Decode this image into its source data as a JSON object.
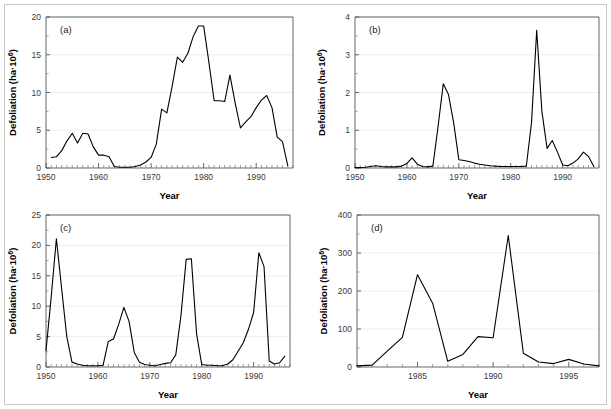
{
  "figure": {
    "background_color": "#ffffff",
    "line_color": "#000000",
    "grid_color": "#e9e9e9",
    "axis_color": "#555555"
  },
  "chart_data": [
    {
      "id": "a",
      "type": "line",
      "panel_label": "(a)",
      "title": "",
      "xlabel": "Year",
      "ylabel": "Defoliation (ha·10⁶)",
      "xlim": [
        1950,
        1997
      ],
      "ylim": [
        0,
        20
      ],
      "xticks": [
        1950,
        1960,
        1970,
        1980,
        1990
      ],
      "xtick_labels": [
        "1950",
        "1960",
        "1970",
        "1980",
        "1990"
      ],
      "yticks": [
        0,
        5,
        10,
        15,
        20
      ],
      "ytick_labels": [
        "0",
        "5",
        "10",
        "15",
        "20"
      ],
      "yminor_step": 2.5,
      "xminor_step": 1,
      "grid": true,
      "legend": "none",
      "x": [
        1951,
        1952,
        1953,
        1954,
        1955,
        1956,
        1957,
        1958,
        1959,
        1960,
        1961,
        1962,
        1963,
        1964,
        1965,
        1966,
        1967,
        1968,
        1969,
        1970,
        1971,
        1972,
        1973,
        1974,
        1975,
        1976,
        1977,
        1978,
        1979,
        1980,
        1981,
        1982,
        1983,
        1984,
        1985,
        1986,
        1987,
        1988,
        1989,
        1990,
        1991,
        1992,
        1993,
        1994,
        1995,
        1996
      ],
      "y": [
        1.4,
        1.5,
        2.3,
        3.6,
        4.6,
        3.3,
        4.6,
        4.5,
        2.8,
        1.7,
        1.7,
        1.5,
        0.2,
        0.1,
        0.1,
        0.1,
        0.2,
        0.4,
        0.8,
        1.4,
        3.2,
        7.8,
        7.3,
        10.8,
        14.7,
        14.0,
        15.2,
        17.4,
        18.8,
        18.8,
        14.0,
        8.9,
        8.9,
        8.8,
        12.3,
        8.6,
        5.3,
        6.1,
        6.8,
        8.0,
        9.0,
        9.6,
        8.0,
        4.1,
        3.5,
        0.3
      ]
    },
    {
      "id": "b",
      "type": "line",
      "panel_label": "(b)",
      "title": "",
      "xlabel": "Year",
      "ylabel": "Defoliation (ha·10⁶)",
      "xlim": [
        1950,
        1997
      ],
      "ylim": [
        0,
        4
      ],
      "xticks": [
        1950,
        1960,
        1970,
        1980,
        1990
      ],
      "xtick_labels": [
        "1950",
        "1960",
        "1970",
        "1980",
        "1990"
      ],
      "yticks": [
        0,
        1,
        2,
        3,
        4
      ],
      "ytick_labels": [
        "0",
        "1",
        "2",
        "3",
        "4"
      ],
      "yminor_step": 0.5,
      "xminor_step": 1,
      "grid": true,
      "legend": "none",
      "x": [
        1950,
        1951,
        1952,
        1953,
        1954,
        1955,
        1956,
        1957,
        1958,
        1959,
        1960,
        1961,
        1962,
        1963,
        1964,
        1965,
        1966,
        1967,
        1968,
        1969,
        1970,
        1971,
        1972,
        1973,
        1974,
        1975,
        1976,
        1977,
        1978,
        1979,
        1980,
        1981,
        1982,
        1983,
        1984,
        1985,
        1986,
        1987,
        1988,
        1989,
        1990,
        1991,
        1992,
        1993,
        1994,
        1995,
        1996
      ],
      "y": [
        0.01,
        0.01,
        0.02,
        0.04,
        0.06,
        0.04,
        0.03,
        0.03,
        0.03,
        0.05,
        0.12,
        0.27,
        0.1,
        0.04,
        0.03,
        0.05,
        1.1,
        2.23,
        1.95,
        1.2,
        0.22,
        0.2,
        0.17,
        0.13,
        0.1,
        0.08,
        0.06,
        0.05,
        0.04,
        0.04,
        0.04,
        0.04,
        0.04,
        0.05,
        1.2,
        3.65,
        1.5,
        0.52,
        0.73,
        0.42,
        0.08,
        0.06,
        0.13,
        0.24,
        0.42,
        0.3,
        0.04
      ]
    },
    {
      "id": "c",
      "type": "line",
      "panel_label": "(c)",
      "title": "",
      "xlabel": "Year",
      "ylabel": "Defoliation (ha·10⁶)",
      "xlim": [
        1950,
        1997
      ],
      "ylim": [
        0,
        25
      ],
      "xticks": [
        1950,
        1960,
        1970,
        1980,
        1990
      ],
      "xtick_labels": [
        "1950",
        "1960",
        "1970",
        "1980",
        "1990"
      ],
      "yticks": [
        0,
        5,
        10,
        15,
        20,
        25
      ],
      "ytick_labels": [
        "0",
        "5",
        "10",
        "15",
        "20",
        "25"
      ],
      "yminor_step": 2.5,
      "xminor_step": 1,
      "grid": true,
      "legend": "none",
      "x": [
        1950,
        1951,
        1952,
        1953,
        1954,
        1955,
        1956,
        1957,
        1958,
        1959,
        1960,
        1961,
        1962,
        1963,
        1964,
        1965,
        1966,
        1967,
        1968,
        1969,
        1970,
        1971,
        1972,
        1973,
        1974,
        1975,
        1976,
        1977,
        1978,
        1979,
        1980,
        1981,
        1982,
        1983,
        1984,
        1985,
        1986,
        1987,
        1988,
        1989,
        1990,
        1991,
        1992,
        1993,
        1994,
        1995,
        1996
      ],
      "y": [
        2.7,
        11.5,
        21.1,
        13.0,
        5.0,
        0.8,
        0.5,
        0.3,
        0.2,
        0.2,
        0.2,
        0.3,
        4.2,
        4.6,
        7.0,
        9.8,
        7.5,
        2.4,
        0.8,
        0.4,
        0.3,
        0.2,
        0.4,
        0.6,
        0.7,
        2.0,
        8.5,
        17.7,
        17.8,
        5.5,
        0.4,
        0.3,
        0.3,
        0.2,
        0.2,
        0.5,
        1.2,
        2.6,
        4.0,
        6.2,
        9.0,
        18.8,
        16.5,
        1.0,
        0.5,
        0.7,
        1.8
      ]
    },
    {
      "id": "d",
      "type": "line",
      "panel_label": "(d)",
      "title": "",
      "xlabel": "Year",
      "ylabel": "Defoliation (ha·10⁶)",
      "xlim": [
        1981,
        1997
      ],
      "ylim": [
        0,
        400
      ],
      "xticks": [
        1985,
        1990,
        1995
      ],
      "xtick_labels": [
        "1985",
        "1990",
        "1995"
      ],
      "yticks": [
        0,
        100,
        200,
        300,
        400
      ],
      "ytick_labels": [
        "0",
        "100",
        "200",
        "300",
        "400"
      ],
      "yminor_step": 50,
      "xminor_step": 1,
      "grid": true,
      "legend": "none",
      "x": [
        1981,
        1982,
        1983,
        1984,
        1985,
        1986,
        1987,
        1988,
        1989,
        1990,
        1991,
        1992,
        1993,
        1994,
        1995,
        1996,
        1997
      ],
      "y": [
        3,
        5,
        42,
        78,
        243,
        168,
        15,
        33,
        80,
        77,
        346,
        36,
        13,
        9,
        20,
        8,
        3
      ]
    }
  ]
}
